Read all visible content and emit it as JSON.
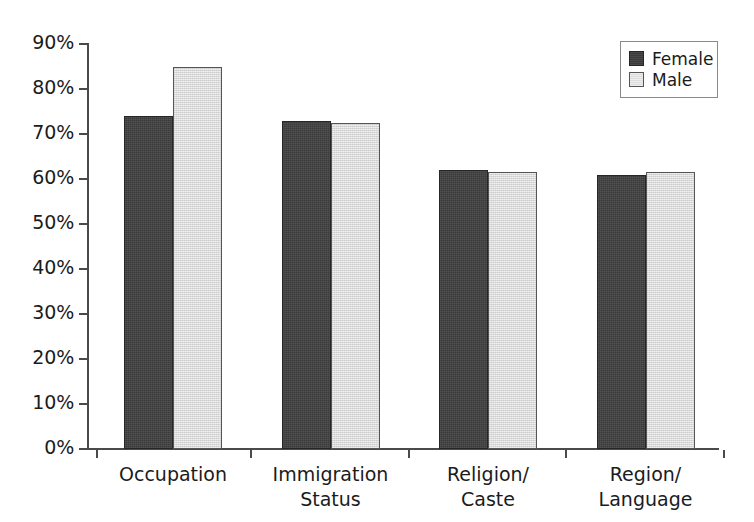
{
  "chart_data": {
    "type": "bar",
    "title": "",
    "subtitle": "",
    "xlabel": "",
    "ylabel": "",
    "ylim": [
      0,
      90
    ],
    "grid": false,
    "legend_position": "top-right",
    "categories": [
      "Occupation",
      "Immigration\nStatus",
      "Religion/\nCaste",
      "Region/\nLanguage"
    ],
    "tick_labels": [
      "0%",
      "10%",
      "20%",
      "30%",
      "40%",
      "50%",
      "60%",
      "70%",
      "80%",
      "90%"
    ],
    "tick_values": [
      0,
      10,
      20,
      30,
      40,
      50,
      60,
      70,
      80,
      90
    ],
    "series": [
      {
        "name": "Female",
        "color": "#3b3b3b",
        "values": [
          74,
          73,
          62,
          61
        ]
      },
      {
        "name": "Male",
        "color": "#d9d9d9",
        "values": [
          85,
          72.5,
          61.5,
          61.5
        ]
      }
    ]
  },
  "legend": {
    "entries": [
      {
        "label": "Female",
        "swatch": "female-swatch"
      },
      {
        "label": "Male",
        "swatch": "male-swatch"
      }
    ]
  },
  "axes": {
    "y_ticks": [
      {
        "label": "90%",
        "value": 90
      },
      {
        "label": "80%",
        "value": 80
      },
      {
        "label": "70%",
        "value": 70
      },
      {
        "label": "60%",
        "value": 60
      },
      {
        "label": "50%",
        "value": 50
      },
      {
        "label": "40%",
        "value": 40
      },
      {
        "label": "30%",
        "value": 30
      },
      {
        "label": "20%",
        "value": 20
      },
      {
        "label": "10%",
        "value": 10
      },
      {
        "label": "0%",
        "value": 0
      }
    ],
    "x_categories": [
      {
        "line1": "Occupation",
        "line2": ""
      },
      {
        "line1": "Immigration",
        "line2": "Status"
      },
      {
        "line1": "Religion/",
        "line2": "Caste"
      },
      {
        "line1": "Region/",
        "line2": "Language"
      }
    ]
  }
}
